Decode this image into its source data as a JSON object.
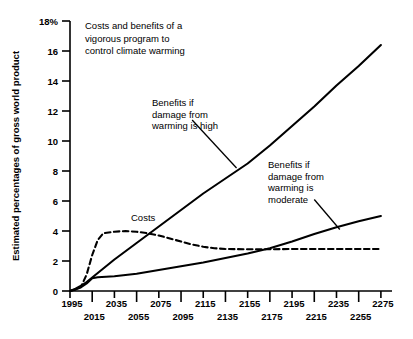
{
  "chart_data": {
    "type": "line",
    "title_lines": [
      "Costs and benefits of a",
      "vigorous program to",
      "control climate warming"
    ],
    "xlabel": "",
    "ylabel": "Estimated percentages of gross world product",
    "xlim": [
      1995,
      2285
    ],
    "ylim": [
      0,
      18
    ],
    "grid": false,
    "legend_position": "inline-annotations",
    "y_ticks": [
      0,
      2,
      4,
      6,
      8,
      10,
      12,
      14,
      16,
      18
    ],
    "y_tick_labels": [
      "0",
      "2",
      "4",
      "6",
      "8",
      "10",
      "12",
      "14",
      "16",
      "18%"
    ],
    "x_ticks": [
      1995,
      2015,
      2035,
      2055,
      2075,
      2095,
      2115,
      2135,
      2155,
      2175,
      2195,
      2215,
      2235,
      2255,
      2275
    ],
    "x_tick_labels_upper": [
      "1995",
      "2035",
      "2075",
      "2115",
      "2155",
      "2195",
      "2235",
      "2275"
    ],
    "x_tick_labels_lower": [
      "2015",
      "2055",
      "2095",
      "2135",
      "2175",
      "2215",
      "2255"
    ],
    "series": [
      {
        "name": "Benefits if damage from warming is high",
        "style": "solid",
        "x": [
          1995,
          2000,
          2005,
          2010,
          2015,
          2025,
          2035,
          2055,
          2075,
          2095,
          2115,
          2135,
          2155,
          2175,
          2195,
          2215,
          2235,
          2255,
          2275
        ],
        "values": [
          0.0,
          0.15,
          0.35,
          0.6,
          0.9,
          1.5,
          2.1,
          3.2,
          4.3,
          5.4,
          6.5,
          7.5,
          8.5,
          9.7,
          11.0,
          12.3,
          13.7,
          15.0,
          16.4
        ]
      },
      {
        "name": "Benefits if damage from warming is moderate",
        "style": "solid",
        "x": [
          1995,
          2000,
          2005,
          2010,
          2015,
          2020,
          2035,
          2055,
          2075,
          2095,
          2115,
          2135,
          2155,
          2175,
          2195,
          2215,
          2235,
          2255,
          2275
        ],
        "values": [
          0.0,
          0.1,
          0.25,
          0.5,
          0.85,
          0.92,
          0.98,
          1.15,
          1.4,
          1.65,
          1.9,
          2.2,
          2.5,
          2.85,
          3.3,
          3.8,
          4.25,
          4.65,
          5.0
        ]
      },
      {
        "name": "Costs",
        "style": "dashed",
        "x": [
          1995,
          2000,
          2005,
          2010,
          2015,
          2020,
          2025,
          2035,
          2045,
          2055,
          2065,
          2075,
          2085,
          2095,
          2105,
          2115,
          2125,
          2135,
          2155,
          2175,
          2195,
          2215,
          2235,
          2255,
          2275
        ],
        "values": [
          0.0,
          0.1,
          0.3,
          1.1,
          2.4,
          3.4,
          3.85,
          3.95,
          4.0,
          3.95,
          3.85,
          3.7,
          3.5,
          3.3,
          3.1,
          2.95,
          2.85,
          2.8,
          2.78,
          2.78,
          2.8,
          2.8,
          2.8,
          2.8,
          2.8
        ]
      }
    ],
    "annotations": [
      {
        "name": "high-damage-label",
        "lines": [
          "Benefits if",
          "damage from",
          "warming is high"
        ],
        "leader_from": [
          2105,
          11.4
        ],
        "leader_to": [
          2145,
          8.2
        ]
      },
      {
        "name": "moderate-damage-label",
        "lines": [
          "Benefits if",
          "damage from",
          "warming is",
          "moderate"
        ],
        "leader_from": [
          2215,
          6.1
        ],
        "leader_to": [
          2238,
          4.1
        ]
      },
      {
        "name": "costs-label",
        "lines": [
          "Costs"
        ],
        "leader_from": null,
        "leader_to": null
      }
    ],
    "colors": {
      "line": "#000000",
      "background": "#ffffff",
      "text": "#000000"
    }
  }
}
